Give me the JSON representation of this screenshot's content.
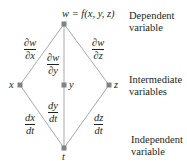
{
  "diagram": {
    "type": "tree",
    "colors": {
      "line": "#a7a9ac",
      "node": "#808285",
      "text": "#231f20"
    },
    "nodes": {
      "top": {
        "label": "w = f(x, y, z)",
        "x": 64,
        "y": 24
      },
      "x": {
        "label": "x",
        "x": 20,
        "y": 85
      },
      "y": {
        "label": "y",
        "x": 64,
        "y": 85
      },
      "z": {
        "label": "z",
        "x": 109,
        "y": 85
      },
      "t": {
        "label": "t",
        "x": 64,
        "y": 148
      }
    },
    "edges": {
      "dw_dx": {
        "num": "∂w",
        "den": "∂x"
      },
      "dw_dy": {
        "num": "∂w",
        "den": "∂y"
      },
      "dw_dz": {
        "num": "∂w",
        "den": "∂z"
      },
      "dx_dt": {
        "num": "dx",
        "den": "dt"
      },
      "dy_dt": {
        "num": "dy",
        "den": "dt"
      },
      "dz_dt": {
        "num": "dz",
        "den": "dt"
      }
    },
    "levels": {
      "dependent": [
        "Dependent",
        "variable"
      ],
      "intermediate": [
        "Intermediate",
        "variables"
      ],
      "independent": [
        "Independent",
        "variable"
      ]
    }
  }
}
